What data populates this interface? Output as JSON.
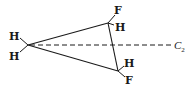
{
  "diagram": {
    "type": "molecular-structure",
    "carbons": [
      {
        "id": "c1",
        "x": 28,
        "y": 45,
        "substituents": [
          "H",
          "H"
        ]
      },
      {
        "id": "c2",
        "x": 108,
        "y": 23,
        "substituents": [
          "F",
          "H"
        ]
      },
      {
        "id": "c3",
        "x": 118,
        "y": 71,
        "substituents": [
          "H",
          "F"
        ]
      }
    ],
    "labels": {
      "c1_top_h": "H",
      "c1_bottom_h": "H",
      "c2_f": "F",
      "c2_h": "H",
      "c3_h": "H",
      "c3_f": "F",
      "axis_letter": "C",
      "axis_subscript": "2"
    },
    "axis": {
      "style": "dashed",
      "from": [
        28,
        45
      ],
      "to": [
        172,
        45
      ]
    },
    "colors": {
      "ink": "#1a1a1a",
      "background": "#ffffff"
    }
  }
}
